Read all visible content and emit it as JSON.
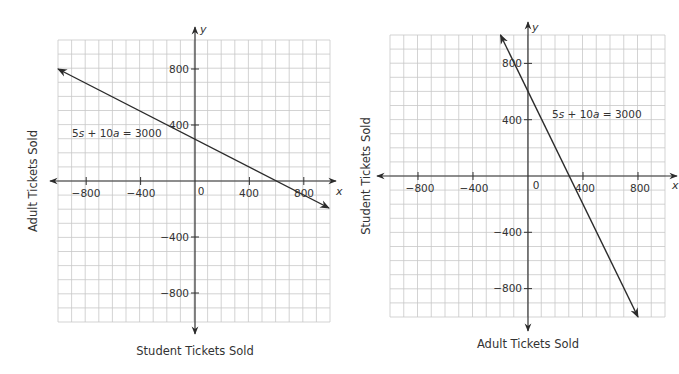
{
  "chart_data": [
    {
      "type": "line",
      "title": "",
      "xlabel": "Student Tickets Sold",
      "ylabel": "Adult Tickets Sold",
      "x_axis_name": "x",
      "y_axis_name": "y",
      "xlim": [
        -1000,
        1000
      ],
      "ylim": [
        -1000,
        1000
      ],
      "grid": true,
      "grid_step": 100,
      "xticks": [
        -800,
        -400,
        0,
        400,
        800
      ],
      "yticks": [
        -800,
        -400,
        400,
        800
      ],
      "tick_labels_x": [
        "−800",
        "−400",
        "0",
        "400",
        "800"
      ],
      "tick_labels_y": [
        "800",
        "400",
        "−400",
        "−800"
      ],
      "series": [
        {
          "name": "5s + 10a = 3000",
          "equation": "5s + 10a = 3000",
          "x": [
            -1000,
            0,
            600,
            960
          ],
          "y": [
            800,
            300,
            0,
            -180
          ],
          "arrows": "both"
        }
      ],
      "annotations": [
        {
          "text": "5s + 10a = 3000",
          "x": -700,
          "y": 360
        }
      ]
    },
    {
      "type": "line",
      "title": "",
      "xlabel": "Adult Tickets Sold",
      "ylabel": "Student Tickets Sold",
      "x_axis_name": "x",
      "y_axis_name": "y",
      "xlim": [
        -1000,
        1000
      ],
      "ylim": [
        -1000,
        1000
      ],
      "grid": true,
      "grid_step": 100,
      "xticks": [
        -800,
        -400,
        0,
        400,
        800
      ],
      "yticks": [
        -800,
        -400,
        400,
        800
      ],
      "tick_labels_x": [
        "−800",
        "−400",
        "0",
        "400",
        "800"
      ],
      "tick_labels_y": [
        "800",
        "400",
        "−400",
        "−800"
      ],
      "series": [
        {
          "name": "5s + 10a = 3000",
          "equation": "5s + 10a = 3000",
          "x": [
            -200,
            0,
            300,
            800
          ],
          "y": [
            1000,
            600,
            0,
            -1000
          ],
          "arrows": "both"
        }
      ],
      "annotations": [
        {
          "text": "5s + 10a = 3000",
          "x": 180,
          "y": 400
        }
      ]
    }
  ],
  "charts": {
    "left": {
      "xlabel": "Student Tickets Sold",
      "ylabel": "Adult Tickets Sold",
      "x_axis_name": "x",
      "y_axis_name": "y",
      "equation": {
        "pre": "5",
        "s": "s",
        "mid": " + 10",
        "a": "a",
        "post": " = 3000"
      },
      "xticks": [
        "−800",
        "−400",
        "400",
        "800"
      ],
      "yticks": [
        "800",
        "400",
        "−400",
        "−800"
      ],
      "origin_label": "0"
    },
    "right": {
      "xlabel": "Adult Tickets Sold",
      "ylabel": "Student Tickets Sold",
      "x_axis_name": "x",
      "y_axis_name": "y",
      "equation": {
        "pre": "5",
        "s": "s",
        "mid": " + 10",
        "a": "a",
        "post": " = 3000"
      },
      "xticks": [
        "−800",
        "−400",
        "400",
        "800"
      ],
      "yticks": [
        "800",
        "400",
        "−400",
        "−800"
      ],
      "origin_label": "0"
    }
  },
  "colors": {
    "grid": "#c8c8c8",
    "axis": "#333333",
    "line": "#2b2b2b",
    "text": "#333333"
  }
}
